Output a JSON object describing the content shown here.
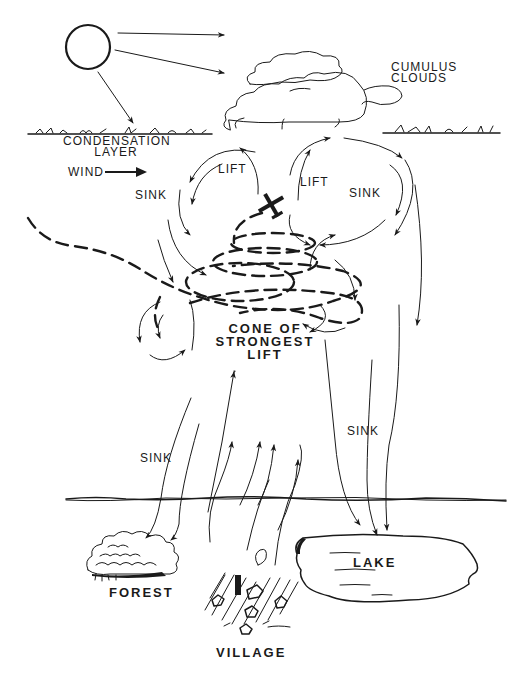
{
  "diagram": {
    "colors": {
      "ink": "#1a1a1a",
      "background": "#ffffff"
    },
    "labels": {
      "cumulus_clouds": [
        "CUMULUS",
        "CLOUDS"
      ],
      "condensation_layer": [
        "CONDENSATION",
        "LAYER"
      ],
      "wind": "WIND",
      "lift_left": "LIFT",
      "lift_right": "LIFT",
      "sink_upper_left": "SINK",
      "sink_upper_right": "SINK",
      "cone_of_strongest_lift": [
        "CONE OF",
        "STRONGEST",
        "LIFT"
      ],
      "sink_lower_left": "SINK",
      "sink_lower_right": "SINK",
      "forest": "FOREST",
      "lake": "LAKE",
      "village": "VILLAGE"
    },
    "elements": [
      {
        "name": "sun",
        "icon": "sun-circle-icon"
      },
      {
        "name": "sun-rays",
        "count": 3
      },
      {
        "name": "cumulus-clouds",
        "count": 3
      },
      {
        "name": "glider",
        "icon": "glider-plane-icon"
      },
      {
        "name": "dashed-flight-path",
        "description": "spiral climbing path inside thermal"
      },
      {
        "name": "ground-horizon-line"
      },
      {
        "name": "forest",
        "icon": "forest-trees-icon"
      },
      {
        "name": "village",
        "icon": "village-houses-icon"
      },
      {
        "name": "lake",
        "icon": "lake-outline-icon"
      }
    ]
  }
}
